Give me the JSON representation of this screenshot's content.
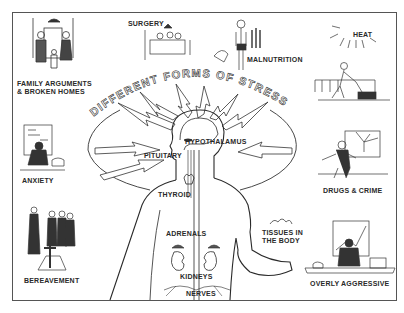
{
  "diagram": {
    "title": "DIFFERENT FORMS OF STRESS",
    "stressors": [
      {
        "id": "family",
        "label_line1": "FAMILY ARGUMENTS",
        "label_line2": "& BROKEN HOMES"
      },
      {
        "id": "surgery",
        "label": "SURGERY"
      },
      {
        "id": "malnutrition",
        "label": "MALNUTRITION"
      },
      {
        "id": "heat",
        "label": "HEAT"
      },
      {
        "id": "anxiety",
        "label": "ANXIETY"
      },
      {
        "id": "drugs",
        "label": "DRUGS & CRIME"
      },
      {
        "id": "bereavement",
        "label": "BEREAVEMENT"
      },
      {
        "id": "aggressive",
        "label": "OVERLY AGGRESSIVE"
      }
    ],
    "body_parts": {
      "hypothalamus": "HYPOTHALAMUS",
      "pituitary": "PITUITARY",
      "thyroid": "THYROID",
      "adrenals": "ADRENALS",
      "kidneys": "KIDNEYS",
      "nerves": "NERVES",
      "tissues_line1": "TISSUES IN",
      "tissues_line2": "THE BODY"
    },
    "colors": {
      "ink": "#2a2a2a",
      "paper": "#ffffff",
      "frame": "#555555"
    }
  }
}
